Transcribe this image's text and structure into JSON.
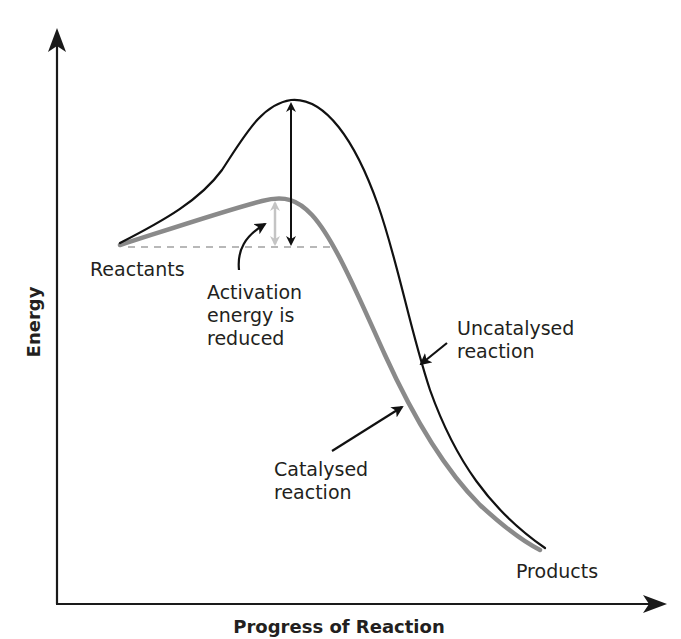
{
  "diagram": {
    "type": "energy-profile",
    "axes": {
      "x_label": "Progress of Reaction",
      "y_label": "Energy"
    },
    "labels": {
      "reactants": "Reactants",
      "products": "Products",
      "activation_line1": "Activation",
      "activation_line2": "energy is",
      "activation_line3": "reduced",
      "uncatalysed_line1": "Uncatalysed",
      "uncatalysed_line2": "reaction",
      "catalysed_line1": "Catalysed",
      "catalysed_line2": "reaction"
    },
    "curves": [
      {
        "name": "Uncatalysed reaction",
        "color": "#111111",
        "peak_energy": "high"
      },
      {
        "name": "Catalysed reaction",
        "color": "#8a8a8a",
        "peak_energy": "lower"
      }
    ],
    "colors": {
      "axis": "#1a1a1a",
      "uncatalysed": "#111111",
      "catalysed": "#8a8a8a",
      "reduced_arrow": "#c4c4c4",
      "dashed_baseline": "#b8b8b8",
      "text": "#231f20"
    }
  }
}
